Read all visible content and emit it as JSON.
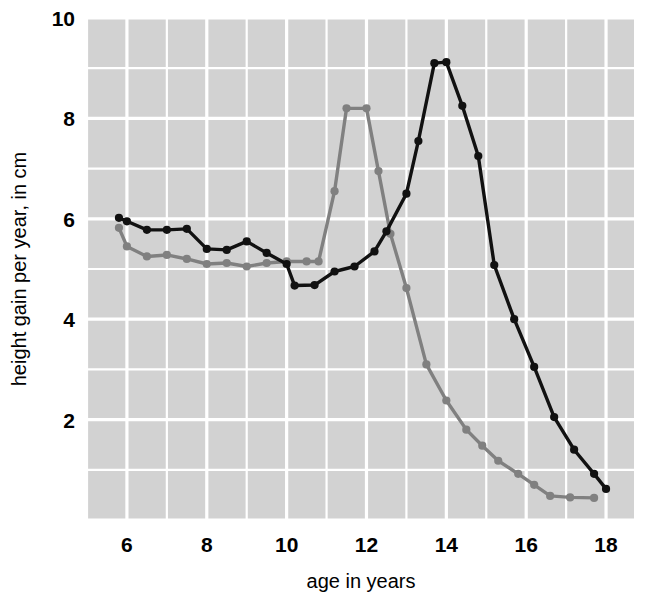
{
  "chart_data": {
    "type": "line",
    "title": "",
    "subtitle": "",
    "xlabel": "age in years",
    "ylabel": "height gain per year, in cm",
    "xlim": [
      5.0,
      18.7
    ],
    "ylim": [
      0.0,
      10.0
    ],
    "xticks": [
      6,
      8,
      10,
      12,
      14,
      16,
      18
    ],
    "xticklabels": [
      "6",
      "8",
      "10",
      "12",
      "14",
      "16",
      "18"
    ],
    "yticks": [
      2,
      4,
      6,
      8,
      10
    ],
    "yticklabels": [
      "2",
      "4",
      "6",
      "8",
      "10"
    ],
    "grid": true,
    "grid_major_step_x": 1,
    "grid_major_step_y": 1,
    "grid_color": "#ffffff",
    "plot_background": "#d2d2d2",
    "figure_background": "#ffffff",
    "legend": null,
    "legend_position": "none",
    "annotations": [],
    "series": [
      {
        "name": "boys",
        "color": "#111111",
        "marker": "circle",
        "linewidth": 3.4,
        "x": [
          5.8,
          6.0,
          6.5,
          7.0,
          7.5,
          8.0,
          8.5,
          9.0,
          9.5,
          10.0,
          10.2,
          10.7,
          11.2,
          11.7,
          12.2,
          12.5,
          13.0,
          13.3,
          13.7,
          14.0,
          14.4,
          14.8,
          15.2,
          15.7,
          16.2,
          16.7,
          17.2,
          17.7,
          18.0
        ],
        "y": [
          6.02,
          5.95,
          5.78,
          5.78,
          5.8,
          5.4,
          5.38,
          5.55,
          5.32,
          5.1,
          4.67,
          4.68,
          4.95,
          5.05,
          5.35,
          5.75,
          6.5,
          7.55,
          9.1,
          9.12,
          8.25,
          7.25,
          5.08,
          4.0,
          3.05,
          2.05,
          1.4,
          0.92,
          0.62
        ]
      },
      {
        "name": "girls",
        "color": "#808080",
        "marker": "circle",
        "linewidth": 3.4,
        "x": [
          5.8,
          6.0,
          6.5,
          7.0,
          7.5,
          8.0,
          8.5,
          9.0,
          9.5,
          10.0,
          10.5,
          10.8,
          11.2,
          11.5,
          12.0,
          12.3,
          12.6,
          13.0,
          13.5,
          14.0,
          14.5,
          14.9,
          15.3,
          15.8,
          16.2,
          16.6,
          17.1,
          17.7
        ],
        "y": [
          5.82,
          5.45,
          5.25,
          5.28,
          5.2,
          5.1,
          5.12,
          5.05,
          5.12,
          5.15,
          5.15,
          5.15,
          6.55,
          8.2,
          8.2,
          6.95,
          5.7,
          4.62,
          3.1,
          2.38,
          1.8,
          1.48,
          1.18,
          0.92,
          0.7,
          0.48,
          0.45,
          0.44
        ]
      }
    ]
  },
  "axes": {
    "x_title": "age in years",
    "y_title": "height gain per year, in cm"
  }
}
